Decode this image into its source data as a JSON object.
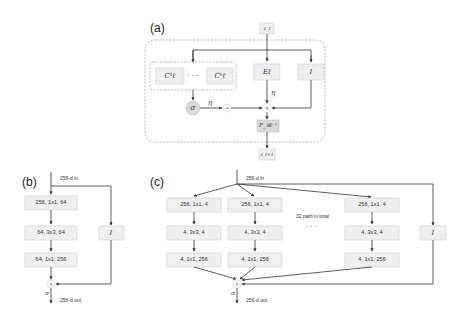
{
  "panels": {
    "a": {
      "label": "(a)",
      "input": "z_ℓ",
      "output": "z_ℓ+1",
      "ensemble_first": "C¹ℓ",
      "ensemble_dots": "· · ·",
      "ensemble_last": "Cᵏℓ",
      "expert": "Eℓ",
      "identity": "I",
      "sigma": "σ",
      "minus": "−",
      "plus": "+",
      "eta_left": "η",
      "eta_down": "η",
      "projection": "P_𝒢ℓ⁻¹"
    },
    "b": {
      "label": "(b)",
      "input": "256-d in",
      "output": "256-d out",
      "boxes": [
        "256, 1x1, 64",
        "64, 3x3, 64",
        "64, 1x1, 256"
      ],
      "identity": "I",
      "plus": "+",
      "sigma": "σ"
    },
    "c": {
      "label": "(c)",
      "input": "256-d in",
      "output": "256-d out",
      "paths": [
        [
          "256, 1x1, 4",
          "4, 3x3, 4",
          "4, 1x1, 256"
        ],
        [
          "256, 1x1, 4",
          "4, 3x3, 4",
          "4, 1x1, 256"
        ],
        [
          "256, 1x1, 4",
          "4, 3x3, 4",
          "4, 1x1, 256"
        ]
      ],
      "note": "32 path in total",
      "dots": "· · ·",
      "identity": "I",
      "plus": "+",
      "sigma": "σ"
    }
  },
  "colors": {
    "box_fill": "#efefef",
    "box_stroke": "#d6d6d6",
    "sigma_fill": "#d9d9d9",
    "line": "#333333",
    "dashed": "#999999"
  }
}
